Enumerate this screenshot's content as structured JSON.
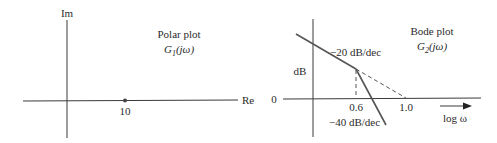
{
  "polar": {
    "title": "Polar plot",
    "function_label": "G",
    "function_sub": "1",
    "function_arg": "(jω)",
    "y_axis_label": "Im",
    "x_axis_label": "Re",
    "point_label": "10"
  },
  "bode": {
    "title": "Bode plot",
    "function_label": "G",
    "function_sub": "2",
    "function_arg": "(jω)",
    "y_axis_label": "dB",
    "zero_label": "0",
    "x_axis_label": "log ω",
    "corner_label": "0.6",
    "crossing_label": "1.0",
    "slope1_label": "−20 dB/dec",
    "slope2_label": "−40 dB/dec"
  },
  "colors": {
    "ink": "#3a3a3a",
    "background": "#ffffff"
  }
}
